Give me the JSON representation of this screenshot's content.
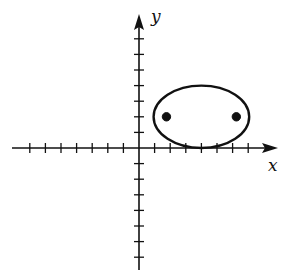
{
  "figure": {
    "type": "coordinate-plane-ellipse",
    "background": "#ffffff",
    "ink_color": "#111111"
  },
  "axes": {
    "x_label": "x",
    "y_label": "y",
    "x_tick_range": [
      -7,
      7
    ],
    "y_tick_range": [
      -7,
      7
    ],
    "tick_labels_shown": false,
    "arrows": [
      "positive-x",
      "positive-y"
    ]
  },
  "ellipse": {
    "center": [
      4,
      2
    ],
    "semi_major_axis": 3,
    "semi_minor_axis": 2,
    "orientation": "horizontal",
    "leftmost": [
      1,
      2
    ],
    "rightmost": [
      7,
      2
    ],
    "top": [
      4,
      4
    ],
    "bottom": [
      4,
      0
    ]
  },
  "points": [
    {
      "name": "focus-left",
      "coords": [
        1.76,
        2
      ],
      "filled": true
    },
    {
      "name": "focus-right",
      "coords": [
        6.24,
        2
      ],
      "filled": true
    }
  ]
}
